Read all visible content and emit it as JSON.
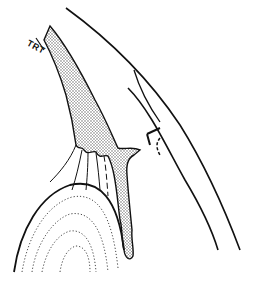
{
  "figure": {
    "type": "anatomical line drawing",
    "labels": {
      "trt": "TRT"
    },
    "colors": {
      "line": "#111111",
      "background": "#ffffff",
      "stipple": "#555555"
    }
  }
}
